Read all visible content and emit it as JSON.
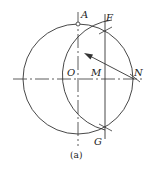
{
  "diagram": {
    "type": "geometric-construction",
    "caption": "(a)",
    "points": {
      "A": {
        "label": "A"
      },
      "F": {
        "label": "F"
      },
      "O": {
        "label": "O"
      },
      "M": {
        "label": "M"
      },
      "N": {
        "label": "N"
      },
      "G": {
        "label": "G"
      }
    },
    "elements": [
      {
        "kind": "circle",
        "center": "O",
        "through": [
          "A",
          "N"
        ]
      },
      {
        "kind": "arc",
        "center": "N",
        "through": [
          "F",
          "O",
          "G"
        ]
      },
      {
        "kind": "line",
        "from": "F",
        "to": "G",
        "passes": "M"
      },
      {
        "kind": "arrow",
        "from": "N",
        "direction": "upper-left",
        "meaning": "radius NF"
      },
      {
        "kind": "centerline",
        "orientation": "vertical",
        "through": [
          "A",
          "O"
        ]
      },
      {
        "kind": "centerline",
        "orientation": "horizontal",
        "through": [
          "O",
          "M",
          "N"
        ]
      }
    ],
    "colors": {
      "stroke": "#333333",
      "background": "#ffffff"
    }
  }
}
